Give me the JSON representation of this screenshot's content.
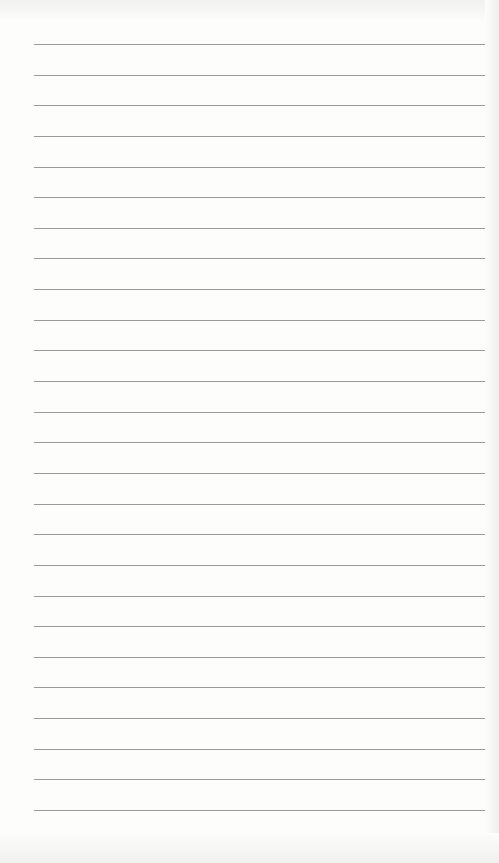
{
  "paper": {
    "type": "lined-notebook-page",
    "line_count": 26,
    "first_line_y": 44,
    "line_spacing": 30.64,
    "line_color": "#9a9a98",
    "paper_color": "#fdfdfc"
  }
}
